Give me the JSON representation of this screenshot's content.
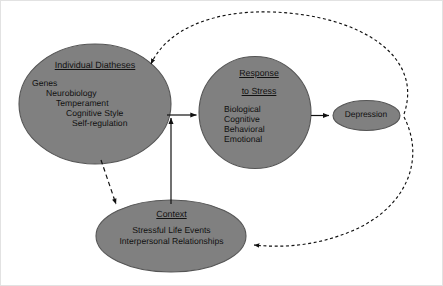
{
  "diagram": {
    "background_color": "#ffffff",
    "node_fill_color": "#808080",
    "node_stroke_color": "#4d4d4d",
    "text_color": "#111111",
    "nodes": {
      "diatheses": {
        "name": "individual-diatheses",
        "title": "Individual Diatheses",
        "items": [
          "Genes",
          "Neurobiology",
          "Temperament",
          "Cognitive Style",
          "Self-regulation"
        ]
      },
      "response": {
        "name": "response-to-stress",
        "title_line1": "Response",
        "title_line2": "to Stress",
        "items": [
          "Biological",
          "Cognitive",
          "Behavioral",
          "Emotional"
        ]
      },
      "context": {
        "name": "context",
        "title": "Context",
        "items": [
          "Stressful Life Events",
          "Interpersonal Relationships"
        ]
      },
      "depression": {
        "name": "depression",
        "title": "Depression"
      }
    },
    "edges": [
      {
        "name": "diatheses-to-response",
        "style": "solid",
        "from": "Individual Diatheses",
        "to": "Response to Stress"
      },
      {
        "name": "context-to-response",
        "style": "solid",
        "from": "Context",
        "to": "Response to Stress"
      },
      {
        "name": "response-to-depression",
        "style": "solid",
        "from": "Response to Stress",
        "to": "Depression"
      },
      {
        "name": "diatheses-to-context",
        "style": "dashed",
        "from": "Individual Diatheses",
        "to": "Context"
      },
      {
        "name": "depression-to-diatheses",
        "style": "dashed",
        "from": "Depression",
        "to": "Individual Diatheses"
      },
      {
        "name": "depression-to-context",
        "style": "dashed",
        "from": "Depression",
        "to": "Context"
      }
    ]
  }
}
